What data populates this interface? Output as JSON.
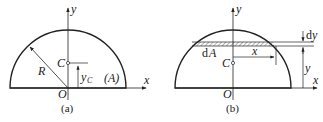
{
  "figure_a": {
    "caption": "(a)",
    "axis_x": "x",
    "axis_y": "y",
    "origin": "O",
    "centroid": "C",
    "radius_label": "R",
    "yc_label": "y",
    "yc_subscript": "C",
    "area_label": "(A)"
  },
  "figure_b": {
    "caption": "(b)",
    "axis_x": "x",
    "axis_y": "y",
    "origin": "O",
    "centroid": "C",
    "strip_label_d": "d",
    "strip_label_A": "A",
    "half_width_label": "x",
    "height_label": "y",
    "dy_label_d": "d",
    "dy_label_y": "y"
  },
  "colors": {
    "line": "#222222",
    "background": "#ffffff",
    "hatch": "#666666"
  }
}
